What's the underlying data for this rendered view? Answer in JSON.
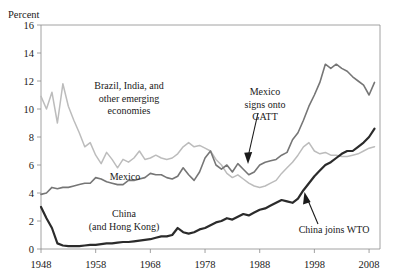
{
  "figure": {
    "cropped_title_fragment": "",
    "background_color": "#ffffff"
  },
  "axes": {
    "y_axis_label": "Percent",
    "y_ticks": [
      "16",
      "14",
      "12",
      "10",
      "8",
      "6",
      "4",
      "2",
      "0"
    ],
    "x_ticks": [
      "1948",
      "1958",
      "1968",
      "1978",
      "1988",
      "1998",
      "2008"
    ]
  },
  "series_labels": {
    "emerging": {
      "line1": "Brazil, India, and",
      "line2": "other emerging",
      "line3": "economies"
    },
    "mexico": {
      "line1": "Mexico"
    },
    "china": {
      "line1": "China",
      "line2": "(and Hong Kong)"
    }
  },
  "annotations": {
    "gatt": {
      "line1": "Mexico",
      "line2": "signs onto",
      "line3": "GATT"
    },
    "wto": {
      "line1": "China joins WTO"
    }
  },
  "colors": {
    "emerging": "#bcbcbc",
    "mexico": "#767676",
    "china": "#2b2b2b",
    "axis": "#8a8a8a",
    "text": "#1a1a1a"
  },
  "chart_data": {
    "type": "line",
    "title": "",
    "xlabel": "",
    "ylabel": "Percent",
    "xlim": [
      1948,
      2010
    ],
    "ylim": [
      0,
      16
    ],
    "grid": false,
    "legend": "inline-labels",
    "x_tick_values": [
      1948,
      1958,
      1968,
      1978,
      1988,
      1998,
      2008
    ],
    "y_tick_values": [
      0,
      2,
      4,
      6,
      8,
      10,
      12,
      14,
      16
    ],
    "x": [
      1948,
      1949,
      1950,
      1951,
      1952,
      1953,
      1954,
      1955,
      1956,
      1957,
      1958,
      1959,
      1960,
      1961,
      1962,
      1963,
      1964,
      1965,
      1966,
      1967,
      1968,
      1969,
      1970,
      1971,
      1972,
      1973,
      1974,
      1975,
      1976,
      1977,
      1978,
      1979,
      1980,
      1981,
      1982,
      1983,
      1984,
      1985,
      1986,
      1987,
      1988,
      1989,
      1990,
      1991,
      1992,
      1993,
      1994,
      1995,
      1996,
      1997,
      1998,
      1999,
      2000,
      2001,
      2002,
      2003,
      2004,
      2005,
      2006,
      2007,
      2008,
      2009
    ],
    "series": [
      {
        "name": "Brazil, India, and other emerging economies",
        "color": "#bcbcbc",
        "values": [
          10.9,
          10.0,
          11.2,
          9.0,
          11.8,
          10.2,
          9.2,
          8.3,
          7.3,
          7.6,
          6.7,
          6.1,
          6.9,
          6.4,
          5.8,
          6.4,
          6.2,
          6.5,
          7.0,
          6.4,
          6.5,
          6.7,
          6.5,
          6.4,
          6.5,
          6.8,
          7.3,
          7.6,
          7.3,
          7.4,
          7.2,
          7.0,
          6.4,
          6.0,
          5.4,
          5.1,
          5.3,
          5.0,
          4.7,
          4.5,
          4.4,
          4.5,
          4.7,
          4.9,
          5.4,
          5.8,
          6.2,
          6.7,
          7.3,
          7.6,
          7.0,
          6.8,
          6.9,
          6.7,
          6.7,
          6.6,
          6.6,
          6.7,
          6.8,
          7.0,
          7.2,
          7.3
        ]
      },
      {
        "name": "Mexico",
        "color": "#767676",
        "values": [
          3.9,
          4.0,
          4.4,
          4.3,
          4.4,
          4.4,
          4.5,
          4.6,
          4.7,
          4.7,
          5.1,
          5.0,
          4.8,
          4.7,
          4.6,
          4.6,
          4.9,
          4.9,
          5.0,
          5.1,
          5.4,
          5.3,
          5.3,
          5.1,
          5.0,
          5.2,
          5.8,
          5.3,
          4.9,
          5.5,
          6.5,
          7.0,
          6.0,
          5.7,
          6.0,
          5.5,
          6.1,
          5.7,
          5.3,
          5.5,
          6.0,
          6.2,
          6.3,
          6.4,
          6.7,
          6.9,
          7.8,
          8.3,
          9.2,
          10.2,
          11.0,
          11.9,
          13.2,
          12.9,
          13.2,
          12.9,
          12.7,
          12.3,
          12.0,
          11.7,
          11.0,
          11.9
        ]
      },
      {
        "name": "China (and Hong Kong)",
        "color": "#2b2b2b",
        "values": [
          3.0,
          2.2,
          1.5,
          0.4,
          0.25,
          0.2,
          0.2,
          0.2,
          0.25,
          0.3,
          0.3,
          0.35,
          0.4,
          0.4,
          0.45,
          0.5,
          0.5,
          0.55,
          0.6,
          0.65,
          0.7,
          0.8,
          0.9,
          0.9,
          1.0,
          1.5,
          1.2,
          1.1,
          1.2,
          1.4,
          1.5,
          1.7,
          1.9,
          2.0,
          2.2,
          2.1,
          2.3,
          2.5,
          2.4,
          2.6,
          2.8,
          2.9,
          3.1,
          3.3,
          3.5,
          3.4,
          3.3,
          3.6,
          4.2,
          4.7,
          5.2,
          5.6,
          6.0,
          6.2,
          6.5,
          6.8,
          7.0,
          7.0,
          7.3,
          7.6,
          8.0,
          8.6
        ]
      }
    ],
    "annotations": [
      {
        "text": "Mexico signs onto GATT",
        "x": 1986,
        "y": 5.7,
        "arrow": "down"
      },
      {
        "text": "China joins WTO",
        "x": 2001,
        "y": 6.0,
        "arrow": "up"
      }
    ]
  }
}
